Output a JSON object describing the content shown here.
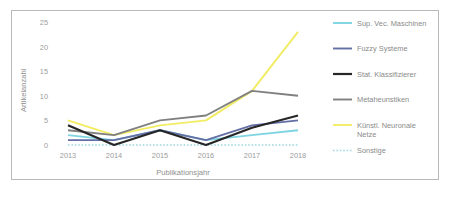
{
  "chart_data": {
    "type": "line",
    "title": "",
    "xlabel": "Publikationsjahr",
    "ylabel": "Artikelanzahl",
    "categories": [
      "2013",
      "2014",
      "2015",
      "2016",
      "2017",
      "2018"
    ],
    "x": [
      2013,
      2014,
      2015,
      2016,
      2017,
      2018
    ],
    "xlim": [
      2013,
      2018
    ],
    "ylim": [
      0,
      25
    ],
    "yticks": [
      0,
      5,
      10,
      15,
      20,
      25
    ],
    "ytick_labels": [
      "0",
      "5",
      "10",
      "15",
      "20",
      "25"
    ],
    "grid": false,
    "legend_position": "right",
    "series": [
      {
        "name": "Sup. Vec. Maschinen",
        "color": "#7FD4E2",
        "style": "solid",
        "values": [
          2,
          1,
          3,
          1,
          2,
          3
        ]
      },
      {
        "name": "Fuzzy Systeme",
        "color": "#646FA6",
        "style": "solid",
        "values": [
          1,
          1,
          3,
          1,
          4,
          5
        ]
      },
      {
        "name": "Stat. Klassifizierer",
        "color": "#262626",
        "style": "solid",
        "values": [
          4,
          0,
          3,
          0,
          3.5,
          6
        ]
      },
      {
        "name": "Metaheunstiken",
        "color": "#808080",
        "style": "solid",
        "values": [
          3,
          2,
          5,
          6,
          11,
          10
        ]
      },
      {
        "name": "Künstl. Neuronale Netze",
        "color": "#F2EC63",
        "style": "solid",
        "values": [
          5,
          2,
          4,
          5,
          11,
          23
        ]
      },
      {
        "name": "Sonstige",
        "color": "#9FD8DE",
        "style": "dotted",
        "values": [
          0,
          0,
          0,
          0,
          0,
          0
        ]
      }
    ]
  },
  "legend": {
    "entries": [
      {
        "label": "Sup. Vec. Maschinen",
        "color": "#7FD4E2",
        "style": "solid"
      },
      {
        "label": "Fuzzy Systeme",
        "color": "#646FA6",
        "style": "solid"
      },
      {
        "label": "Stat. Klassifizierer",
        "color": "#262626",
        "style": "solid"
      },
      {
        "label": "Metaheunstiken",
        "color": "#808080",
        "style": "solid"
      },
      {
        "label": "Künstl. Neuronale",
        "label2": "Netze",
        "color": "#F2EC63",
        "style": "solid"
      },
      {
        "label": "Sonstige",
        "color": "#9FD8DE",
        "style": "dotted"
      }
    ]
  },
  "axes": {
    "y_title": "Artikelanzahl",
    "x_title": "Publikationsjahr",
    "y_labels": [
      "25",
      "20",
      "15",
      "10",
      "5",
      "0"
    ],
    "x_labels": [
      "2013",
      "2014",
      "2015",
      "2016",
      "2017",
      "2018"
    ]
  },
  "colors": {
    "frame": "#b9b9b9",
    "text": "#8f8f8f",
    "background": "#ffffff"
  }
}
